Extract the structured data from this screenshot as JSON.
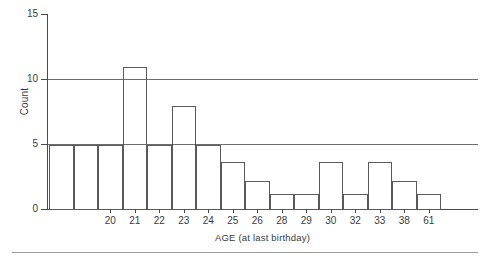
{
  "chart_data": {
    "type": "bar",
    "title": "",
    "xlabel": "AGE (at last birthday)",
    "ylabel": "Count",
    "ylim": [
      0,
      15
    ],
    "ytick_labels": [
      "0",
      "5",
      "10",
      "15"
    ],
    "ytick_values": [
      0,
      5,
      10,
      15
    ],
    "grid": "horizontal gridlines at 5 and 10",
    "legend": "none",
    "categories": [
      "",
      "",
      "20",
      "21",
      "22",
      "23",
      "24",
      "25",
      "26",
      "28",
      "29",
      "30",
      "32",
      "33",
      "38",
      "61"
    ],
    "values": [
      5,
      5,
      5,
      11,
      5,
      8,
      5,
      3.7,
      2.2,
      1.2,
      1.2,
      3.7,
      1.2,
      3.7,
      2.2,
      1.2
    ],
    "tick_labels": [
      "20",
      "21",
      "22",
      "23",
      "24",
      "25",
      "26",
      "28",
      "29",
      "30",
      "32",
      "33",
      "38",
      "61"
    ]
  },
  "axes": {
    "y_title": "Count",
    "x_title": "AGE (at last birthday)",
    "y_labels": {
      "t0": "0",
      "t5": "5",
      "t10": "10",
      "t15": "15"
    }
  },
  "colors": {
    "bar_outline": "#5a5a5a",
    "axis": "#4a4a4a",
    "gridline": "#6e6e6e",
    "text": "#3b3b3b",
    "background": "#ffffff",
    "rule": "#9a9a9a"
  }
}
